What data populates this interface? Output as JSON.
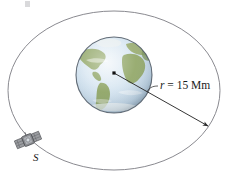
{
  "figure": {
    "type": "orbit-diagram",
    "background_color": "#ffffff",
    "width": 228,
    "height": 179,
    "radius_label": {
      "symbol": "r",
      "equals": " = ",
      "value": "15 Mm",
      "full_text": "r = 15 Mm"
    },
    "satellite_label": "S",
    "colors": {
      "orbit_stroke": "#8a8a90",
      "radius_line": "#2b2b2b",
      "center_dot": "#111111",
      "ocean": "#cfe0ee",
      "ocean_light": "#e6eef6",
      "land": "#93a86a",
      "land_dark": "#7d955a",
      "globe_edge": "#4a5560",
      "satellite_body": "#8d8f93",
      "satellite_dark": "#5f6165",
      "text": "#1a1a1a"
    },
    "geometry": {
      "orbit_center_x": 114,
      "orbit_center_y": 90.5,
      "orbit_radius_x": 106,
      "orbit_radius_y": 79.5,
      "globe_center_x": 114,
      "globe_center_y": 75,
      "globe_radius": 38,
      "center_dot_x": 114,
      "center_dot_y": 73,
      "arrow_tip_x": 208,
      "arrow_tip_y": 126,
      "satellite_x": 28,
      "satellite_y": 140
    }
  }
}
